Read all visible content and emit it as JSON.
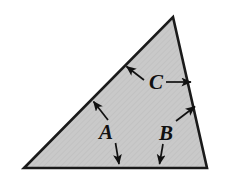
{
  "figure": {
    "name": "shaded-triangle-with-labeled-sides",
    "type": "geometry-diagram",
    "background_color": "#ffffff",
    "shape": {
      "name": "triangle",
      "fill_color": "#c9c9c9",
      "stroke_color": "#1a1a1a",
      "stroke_width": 2.5,
      "texture": "fine-diagonal-hatch",
      "vertices": [
        {
          "id": "apex",
          "x": 173,
          "y": 17
        },
        {
          "id": "bottom-right",
          "x": 207,
          "y": 168
        },
        {
          "id": "bottom-left",
          "x": 24,
          "y": 168
        }
      ],
      "sides": [
        {
          "id": "left-side",
          "from": "bottom-left",
          "to": "apex",
          "label": "A"
        },
        {
          "id": "bottom-side",
          "from": "bottom-left",
          "to": "bottom-right",
          "label": "A"
        },
        {
          "id": "right-side",
          "from": "apex",
          "to": "bottom-right",
          "label": "B"
        }
      ]
    },
    "labels": [
      {
        "id": "label-a",
        "text": "A",
        "x": 112,
        "y": 138,
        "arrows": [
          {
            "id": "arrow-a-up-left",
            "x1": 108,
            "y1": 120,
            "x2": 93,
            "y2": 101
          },
          {
            "id": "arrow-a-down",
            "x1": 116,
            "y1": 143,
            "x2": 119,
            "y2": 165
          }
        ]
      },
      {
        "id": "label-b",
        "text": "B",
        "x": 166,
        "y": 139,
        "arrows": [
          {
            "id": "arrow-b-up-right",
            "x1": 177,
            "y1": 120,
            "x2": 196,
            "y2": 106
          },
          {
            "id": "arrow-b-down-left",
            "x1": 163,
            "y1": 144,
            "x2": 159,
            "y2": 165
          }
        ]
      },
      {
        "id": "label-c",
        "text": "C",
        "x": 152,
        "y": 88,
        "arrows": [
          {
            "id": "arrow-c-up-left",
            "x1": 145,
            "y1": 81,
            "x2": 126,
            "y2": 66
          },
          {
            "id": "arrow-c-right",
            "x1": 167,
            "y1": 82,
            "x2": 193,
            "y2": 82
          }
        ]
      }
    ],
    "arrow_style": {
      "stroke_color": "#111111",
      "stroke_width": 1.6,
      "head_color": "#111111"
    }
  }
}
